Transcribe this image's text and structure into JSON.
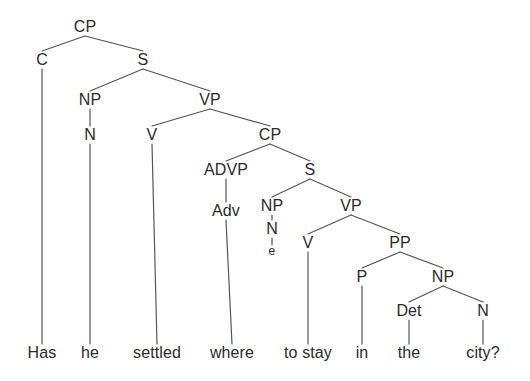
{
  "diagram": {
    "type": "syntax-tree",
    "sentence": "Has he settled where to stay in the city?",
    "line_color": "#555555",
    "text_color": "#2b2b2b",
    "background_color": "#ffffff",
    "nodes": [
      {
        "id": "cp1",
        "label": "CP",
        "x": 85,
        "y": 27,
        "kind": "nonterminal"
      },
      {
        "id": "c1",
        "label": "C",
        "x": 42,
        "y": 60,
        "kind": "nonterminal"
      },
      {
        "id": "s1",
        "label": "S",
        "x": 143,
        "y": 60,
        "kind": "nonterminal"
      },
      {
        "id": "np1",
        "label": "NP",
        "x": 90,
        "y": 100,
        "kind": "nonterminal"
      },
      {
        "id": "vp1",
        "label": "VP",
        "x": 210,
        "y": 100,
        "kind": "nonterminal"
      },
      {
        "id": "n1",
        "label": "N",
        "x": 90,
        "y": 135,
        "kind": "nonterminal"
      },
      {
        "id": "v1",
        "label": "V",
        "x": 152,
        "y": 135,
        "kind": "nonterminal"
      },
      {
        "id": "cp2",
        "label": "CP",
        "x": 270,
        "y": 135,
        "kind": "nonterminal"
      },
      {
        "id": "advp1",
        "label": "ADVP",
        "x": 226,
        "y": 170,
        "kind": "nonterminal"
      },
      {
        "id": "s2",
        "label": "S",
        "x": 310,
        "y": 170,
        "kind": "nonterminal"
      },
      {
        "id": "adv1",
        "label": "Adv",
        "x": 226,
        "y": 211,
        "kind": "nonterminal"
      },
      {
        "id": "np2",
        "label": "NP",
        "x": 272,
        "y": 206,
        "kind": "nonterminal"
      },
      {
        "id": "vp2",
        "label": "VP",
        "x": 351,
        "y": 206,
        "kind": "nonterminal"
      },
      {
        "id": "n2",
        "label": "N",
        "x": 272,
        "y": 229,
        "kind": "nonterminal"
      },
      {
        "id": "v2",
        "label": "V",
        "x": 308,
        "y": 243,
        "kind": "nonterminal"
      },
      {
        "id": "pp1",
        "label": "PP",
        "x": 400,
        "y": 243,
        "kind": "nonterminal"
      },
      {
        "id": "e1",
        "label": "e",
        "x": 272,
        "y": 251,
        "kind": "empty"
      },
      {
        "id": "p1",
        "label": "P",
        "x": 362,
        "y": 277,
        "kind": "nonterminal"
      },
      {
        "id": "np3",
        "label": "NP",
        "x": 443,
        "y": 277,
        "kind": "nonterminal"
      },
      {
        "id": "det1",
        "label": "Det",
        "x": 409,
        "y": 311,
        "kind": "nonterminal"
      },
      {
        "id": "n3",
        "label": "N",
        "x": 483,
        "y": 311,
        "kind": "nonterminal"
      },
      {
        "id": "w1",
        "label": "Has",
        "x": 42,
        "y": 353,
        "kind": "terminal"
      },
      {
        "id": "w2",
        "label": "he",
        "x": 90,
        "y": 353,
        "kind": "terminal"
      },
      {
        "id": "w3",
        "label": "settled",
        "x": 157,
        "y": 353,
        "kind": "terminal"
      },
      {
        "id": "w4",
        "label": "where",
        "x": 232,
        "y": 353,
        "kind": "terminal"
      },
      {
        "id": "w5",
        "label": "to stay",
        "x": 308,
        "y": 353,
        "kind": "terminal"
      },
      {
        "id": "w6",
        "label": "in",
        "x": 362,
        "y": 353,
        "kind": "terminal"
      },
      {
        "id": "w7",
        "label": "the",
        "x": 409,
        "y": 353,
        "kind": "terminal"
      },
      {
        "id": "w8",
        "label": "city?",
        "x": 483,
        "y": 353,
        "kind": "terminal"
      }
    ],
    "edges": [
      {
        "from": "cp1",
        "to": "c1"
      },
      {
        "from": "cp1",
        "to": "s1"
      },
      {
        "from": "s1",
        "to": "np1"
      },
      {
        "from": "s1",
        "to": "vp1"
      },
      {
        "from": "np1",
        "to": "n1"
      },
      {
        "from": "vp1",
        "to": "v1"
      },
      {
        "from": "vp1",
        "to": "cp2"
      },
      {
        "from": "cp2",
        "to": "advp1"
      },
      {
        "from": "cp2",
        "to": "s2"
      },
      {
        "from": "advp1",
        "to": "adv1"
      },
      {
        "from": "s2",
        "to": "np2"
      },
      {
        "from": "s2",
        "to": "vp2"
      },
      {
        "from": "np2",
        "to": "n2"
      },
      {
        "from": "n2",
        "to": "e1"
      },
      {
        "from": "vp2",
        "to": "v2"
      },
      {
        "from": "vp2",
        "to": "pp1"
      },
      {
        "from": "pp1",
        "to": "p1"
      },
      {
        "from": "pp1",
        "to": "np3"
      },
      {
        "from": "np3",
        "to": "det1"
      },
      {
        "from": "np3",
        "to": "n3"
      },
      {
        "from": "c1",
        "to": "w1"
      },
      {
        "from": "n1",
        "to": "w2"
      },
      {
        "from": "v1",
        "to": "w3"
      },
      {
        "from": "adv1",
        "to": "w4"
      },
      {
        "from": "v2",
        "to": "w5"
      },
      {
        "from": "p1",
        "to": "w6"
      },
      {
        "from": "det1",
        "to": "w7"
      },
      {
        "from": "n3",
        "to": "w8"
      }
    ]
  }
}
